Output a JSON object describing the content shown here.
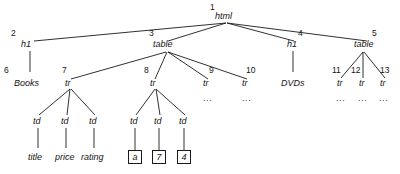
{
  "diagram": {
    "type": "node-link-tree",
    "stroke_color": "#1a1a1a",
    "text_color": "#141414",
    "background": "#ffffff",
    "ellipsis": "...",
    "nodes": [
      {
        "id": "n1",
        "index": "1",
        "label": "html",
        "x": 226,
        "y": 23,
        "style": "tag",
        "index_x": 210,
        "index_y": 3,
        "label_x": 215,
        "label_y": 12
      },
      {
        "id": "n2",
        "index": "2",
        "label": "h1",
        "x": 32,
        "y": 48,
        "style": "tag",
        "index_x": 11,
        "index_y": 29,
        "label_x": 21,
        "label_y": 40
      },
      {
        "id": "n3",
        "index": "3",
        "label": "table",
        "x": 167,
        "y": 48,
        "style": "tag",
        "index_x": 149,
        "index_y": 29,
        "label_x": 153,
        "label_y": 40
      },
      {
        "id": "n4",
        "index": "4",
        "label": "h1",
        "x": 295,
        "y": 48,
        "style": "tag",
        "index_x": 298,
        "index_y": 29,
        "label_x": 287,
        "label_y": 40
      },
      {
        "id": "n5",
        "index": "5",
        "label": "table",
        "x": 368,
        "y": 48,
        "style": "tag",
        "index_x": 372,
        "index_y": 29,
        "label_x": 354,
        "label_y": 40
      },
      {
        "id": "n6",
        "index": "6",
        "label": "Books",
        "x": 32,
        "y": 86,
        "style": "tag",
        "index_x": 4,
        "index_y": 66,
        "label_x": 14,
        "label_y": 79
      },
      {
        "id": "n7",
        "index": "7",
        "label": "tr",
        "x": 70,
        "y": 86,
        "style": "tag",
        "index_x": 62,
        "index_y": 66,
        "label_x": 65,
        "label_y": 79
      },
      {
        "id": "n8",
        "index": "8",
        "label": "tr",
        "x": 155,
        "y": 86,
        "style": "tag",
        "index_x": 144,
        "index_y": 66,
        "label_x": 150,
        "label_y": 79
      },
      {
        "id": "n9",
        "index": "9",
        "label": "tr",
        "x": 208,
        "y": 86,
        "style": "tag",
        "index_x": 209,
        "index_y": 66,
        "label_x": 203,
        "label_y": 79
      },
      {
        "id": "n10",
        "index": "10",
        "label": "tr",
        "x": 247,
        "y": 86,
        "style": "tag",
        "index_x": 246,
        "index_y": 66,
        "label_x": 242,
        "label_y": 79
      },
      {
        "id": "n11",
        "index": "11",
        "label": "tr",
        "x": 341,
        "y": 86,
        "style": "tag",
        "index_x": 332,
        "index_y": 66,
        "label_x": 337,
        "label_y": 79
      },
      {
        "id": "n12",
        "index": "12",
        "label": "tr",
        "x": 363,
        "y": 86,
        "style": "tag",
        "index_x": 351,
        "index_y": 66,
        "label_x": 359,
        "label_y": 79
      },
      {
        "id": "n13",
        "index": "13",
        "label": "tr",
        "x": 384,
        "y": 86,
        "style": "tag",
        "index_x": 380,
        "index_y": 66,
        "label_x": 380,
        "label_y": 79
      },
      {
        "id": "nDVDs",
        "index": "",
        "label": "DVDs",
        "x": 295,
        "y": 86,
        "style": "tag",
        "index_x": 0,
        "index_y": 0,
        "label_x": 281,
        "label_y": 79
      },
      {
        "id": "td1",
        "index": "",
        "label": "td",
        "x": 38,
        "y": 124,
        "style": "tag",
        "index_x": 0,
        "index_y": 0,
        "label_x": 33,
        "label_y": 117
      },
      {
        "id": "td2",
        "index": "",
        "label": "td",
        "x": 66,
        "y": 124,
        "style": "tag",
        "index_x": 0,
        "index_y": 0,
        "label_x": 61,
        "label_y": 117
      },
      {
        "id": "td3",
        "index": "",
        "label": "td",
        "x": 94,
        "y": 124,
        "style": "tag",
        "index_x": 0,
        "index_y": 0,
        "label_x": 89,
        "label_y": 117
      },
      {
        "id": "td4",
        "index": "",
        "label": "td",
        "x": 135,
        "y": 124,
        "style": "tag",
        "index_x": 0,
        "index_y": 0,
        "label_x": 130,
        "label_y": 117
      },
      {
        "id": "td5",
        "index": "",
        "label": "td",
        "x": 159,
        "y": 124,
        "style": "tag",
        "index_x": 0,
        "index_y": 0,
        "label_x": 154,
        "label_y": 117
      },
      {
        "id": "td6",
        "index": "",
        "label": "td",
        "x": 184,
        "y": 124,
        "style": "tag",
        "index_x": 0,
        "index_y": 0,
        "label_x": 179,
        "label_y": 117
      },
      {
        "id": "lf1",
        "index": "",
        "label": "title",
        "x": 38,
        "y": 160,
        "style": "tag",
        "index_x": 0,
        "index_y": 0,
        "label_x": 28,
        "label_y": 153
      },
      {
        "id": "lf2",
        "index": "",
        "label": "price",
        "x": 66,
        "y": 160,
        "style": "tag",
        "index_x": 0,
        "index_y": 0,
        "label_x": 55,
        "label_y": 153
      },
      {
        "id": "lf3",
        "index": "",
        "label": "rating",
        "x": 94,
        "y": 160,
        "style": "tag",
        "index_x": 0,
        "index_y": 0,
        "label_x": 81,
        "label_y": 153
      }
    ],
    "boxed_leaves": [
      {
        "id": "b1",
        "label": "a",
        "x": 128,
        "y": 150
      },
      {
        "id": "b2",
        "label": "7",
        "x": 152,
        "y": 150
      },
      {
        "id": "b3",
        "label": "4",
        "x": 177,
        "y": 150
      }
    ],
    "ellipses": [
      {
        "id": "e1",
        "x": 203,
        "y": 94
      },
      {
        "id": "e2",
        "x": 242,
        "y": 94
      },
      {
        "id": "e3",
        "x": 336,
        "y": 94
      },
      {
        "id": "e4",
        "x": 358,
        "y": 94
      },
      {
        "id": "e5",
        "x": 379,
        "y": 94
      }
    ],
    "edges": [
      {
        "from": "n1",
        "to": "n2",
        "x1": 226,
        "y1": 23,
        "x2": 34,
        "y2": 41
      },
      {
        "from": "n1",
        "to": "n3",
        "x1": 226,
        "y1": 23,
        "x2": 168,
        "y2": 41
      },
      {
        "from": "n1",
        "to": "n4",
        "x1": 227,
        "y1": 23,
        "x2": 294,
        "y2": 41
      },
      {
        "from": "n1",
        "to": "n5",
        "x1": 227,
        "y1": 23,
        "x2": 367,
        "y2": 41
      },
      {
        "from": "n2",
        "to": "n6",
        "x1": 30,
        "y1": 51,
        "x2": 30,
        "y2": 72
      },
      {
        "from": "n3",
        "to": "n7",
        "x1": 166,
        "y1": 52,
        "x2": 71,
        "y2": 79
      },
      {
        "from": "n3",
        "to": "n8",
        "x1": 167,
        "y1": 52,
        "x2": 155,
        "y2": 79
      },
      {
        "from": "n3",
        "to": "n9",
        "x1": 168,
        "y1": 52,
        "x2": 208,
        "y2": 79
      },
      {
        "from": "n3",
        "to": "n10",
        "x1": 168,
        "y1": 52,
        "x2": 247,
        "y2": 79
      },
      {
        "from": "n4",
        "to": "nDVDs",
        "x1": 293,
        "y1": 51,
        "x2": 293,
        "y2": 72
      },
      {
        "from": "n5",
        "to": "n11",
        "x1": 363,
        "y1": 52,
        "x2": 341,
        "y2": 78
      },
      {
        "from": "n5",
        "to": "n12",
        "x1": 363,
        "y1": 52,
        "x2": 363,
        "y2": 78
      },
      {
        "from": "n5",
        "to": "n13",
        "x1": 364,
        "y1": 52,
        "x2": 385,
        "y2": 78
      },
      {
        "from": "n7",
        "to": "td1",
        "x1": 70,
        "y1": 89,
        "x2": 39,
        "y2": 115
      },
      {
        "from": "n7",
        "to": "td2",
        "x1": 70,
        "y1": 89,
        "x2": 67,
        "y2": 115
      },
      {
        "from": "n7",
        "to": "td3",
        "x1": 71,
        "y1": 89,
        "x2": 95,
        "y2": 115
      },
      {
        "from": "n8",
        "to": "td4",
        "x1": 155,
        "y1": 89,
        "x2": 136,
        "y2": 115
      },
      {
        "from": "n8",
        "to": "td5",
        "x1": 156,
        "y1": 89,
        "x2": 160,
        "y2": 115
      },
      {
        "from": "n8",
        "to": "td6",
        "x1": 156,
        "y1": 89,
        "x2": 185,
        "y2": 115
      },
      {
        "from": "td1",
        "to": "lf1",
        "x1": 38,
        "y1": 128,
        "x2": 38,
        "y2": 148
      },
      {
        "from": "td2",
        "to": "lf2",
        "x1": 66,
        "y1": 128,
        "x2": 66,
        "y2": 148
      },
      {
        "from": "td3",
        "to": "lf3",
        "x1": 94,
        "y1": 128,
        "x2": 94,
        "y2": 148
      },
      {
        "from": "td4",
        "to": "b1",
        "x1": 135,
        "y1": 128,
        "x2": 135,
        "y2": 150
      },
      {
        "from": "td5",
        "to": "b2",
        "x1": 159,
        "y1": 128,
        "x2": 159,
        "y2": 150
      },
      {
        "from": "td6",
        "to": "b3",
        "x1": 184,
        "y1": 128,
        "x2": 184,
        "y2": 150
      }
    ]
  }
}
